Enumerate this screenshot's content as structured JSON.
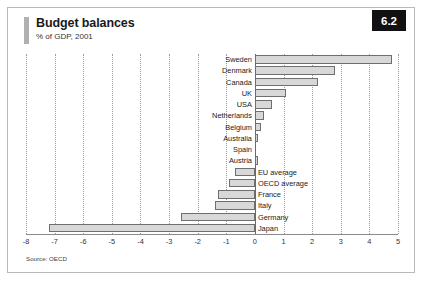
{
  "header": {
    "title": "Budget balances",
    "subtitle": "% of GDP, 2001",
    "badge": "6.2"
  },
  "source": "Source: OECD",
  "chart_data": {
    "type": "bar",
    "orientation": "horizontal",
    "title": "Budget balances",
    "subtitle": "% of GDP, 2001",
    "xlabel": "",
    "ylabel": "",
    "xlim": [
      -8,
      5
    ],
    "xticks": [
      -8,
      -7,
      -6,
      -5,
      -4,
      -3,
      -2,
      -1,
      0,
      1,
      2,
      3,
      4,
      5
    ],
    "xtick_labels": [
      "-8",
      "-7",
      "-6",
      "-5",
      "-4",
      "-3",
      "-2",
      "-1",
      "0",
      "1",
      "2",
      "3",
      "4",
      "5"
    ],
    "grid": true,
    "legend": false,
    "categories": [
      "Sweden",
      "Denmark",
      "Canada",
      "UK",
      "USA",
      "Netherlands",
      "Belgium",
      "Australia",
      "Spain",
      "Austria",
      "EU average",
      "OECD average",
      "France",
      "Italy",
      "Germany",
      "Japan"
    ],
    "values": [
      4.8,
      2.8,
      2.2,
      1.1,
      0.6,
      0.3,
      0.2,
      0.1,
      0.0,
      0.1,
      -0.7,
      -0.9,
      -1.3,
      -1.4,
      -2.6,
      -7.2
    ],
    "bar_color": "#d8d8d8",
    "bar_edge_color": "#6f6f6f"
  }
}
